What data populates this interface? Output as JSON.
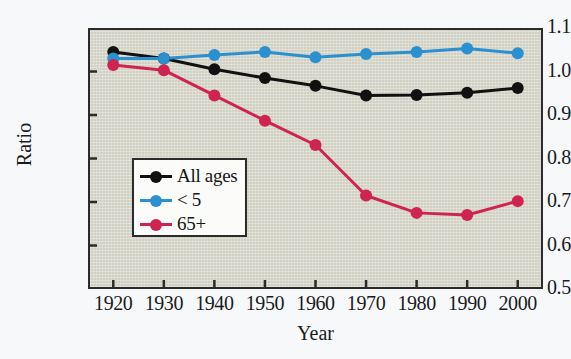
{
  "chart_data": {
    "type": "line",
    "title": "",
    "xlabel": "Year",
    "ylabel": "Ratio",
    "x": [
      1920,
      1930,
      1940,
      1950,
      1960,
      1970,
      1980,
      1990,
      2000
    ],
    "xtick_labels": [
      "1920",
      "1930",
      "1940",
      "1950",
      "1960",
      "1970",
      "1980",
      "1990",
      "2000"
    ],
    "ytick_labels": [
      "0.5",
      "0.6",
      "0.7",
      "0.8",
      "0.9",
      "1.0",
      "1.1"
    ],
    "ytick_values": [
      0.5,
      0.6,
      0.7,
      0.8,
      0.9,
      1.0,
      1.1
    ],
    "xlim": [
      1915,
      2005
    ],
    "ylim": [
      0.5,
      1.1
    ],
    "grid": false,
    "legend_position": "lower-left-inside",
    "series": [
      {
        "name": "All ages",
        "color": "#111111",
        "marker": "circle",
        "values": [
          1.045,
          1.03,
          1.005,
          0.985,
          0.967,
          0.945,
          0.946,
          0.951,
          0.962
        ]
      },
      {
        "name": "< 5",
        "color": "#2b90cf",
        "marker": "circle",
        "values": [
          1.03,
          1.03,
          1.038,
          1.045,
          1.033,
          1.04,
          1.045,
          1.053,
          1.042
        ]
      },
      {
        "name": "65+",
        "color": "#cf2350",
        "marker": "circle",
        "values": [
          1.015,
          1.003,
          0.945,
          0.887,
          0.831,
          0.715,
          0.675,
          0.67,
          0.702
        ]
      }
    ]
  },
  "figure": {
    "background_color": "#f6f8fa",
    "plot_background_color": "#d0d0c3",
    "axis_color": "#2b2b2b"
  },
  "legend": {
    "items": [
      {
        "label": "All ages",
        "color": "#111111"
      },
      {
        "label": "< 5",
        "color": "#2b90cf"
      },
      {
        "label": "65+",
        "color": "#cf2350"
      }
    ]
  }
}
